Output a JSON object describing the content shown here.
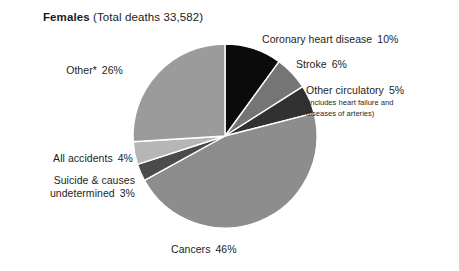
{
  "title": {
    "strong": "Females",
    "regular": "(Total deaths 33,582)"
  },
  "chart_data": {
    "type": "pie",
    "title": "Females (Total deaths 33,582)",
    "total_deaths": "33,582",
    "total_deaths_value": 33582,
    "units": "percent",
    "start_angle_deg": 0,
    "direction": "clockwise",
    "legend": "none (labels placed around perimeter)",
    "grid": false,
    "categories": [
      "Coronary heart disease",
      "Stroke",
      "Other circulatory",
      "Cancers",
      "Suicide & causes undetermined",
      "All accidents",
      "Other*"
    ],
    "values": [
      10,
      6,
      5,
      46,
      3,
      4,
      26
    ],
    "colors": [
      "#0b0b0b",
      "#757575",
      "#313131",
      "#8d8d8d",
      "#4b4b4b",
      "#b6b6b6",
      "#9b9b9b"
    ],
    "slices": [
      {
        "label": "Coronary heart disease",
        "percent": 10,
        "percent_text": "10%",
        "color": "#0b0b0b",
        "start_deg": 0,
        "end_deg": 36
      },
      {
        "label": "Stroke",
        "percent": 6,
        "percent_text": "6%",
        "color": "#757575",
        "start_deg": 36,
        "end_deg": 57.6
      },
      {
        "label": "Other circulatory",
        "sublabel": "(includes heart failure and diseases of arteries)",
        "percent": 5,
        "percent_text": "5%",
        "color": "#313131",
        "start_deg": 57.6,
        "end_deg": 75.6
      },
      {
        "label": "Cancers",
        "percent": 46,
        "percent_text": "46%",
        "color": "#8d8d8d",
        "start_deg": 75.6,
        "end_deg": 241.2
      },
      {
        "label": "Suicide & causes undetermined",
        "percent": 3,
        "percent_text": "3%",
        "color": "#4b4b4b",
        "start_deg": 241.2,
        "end_deg": 252
      },
      {
        "label": "All accidents",
        "percent": 4,
        "percent_text": "4%",
        "color": "#b6b6b6",
        "start_deg": 252,
        "end_deg": 266.4
      },
      {
        "label": "Other*",
        "percent": 26,
        "percent_text": "26%",
        "color": "#9b9b9b",
        "start_deg": 266.4,
        "end_deg": 360
      }
    ]
  },
  "labels": {
    "coronary_heart_disease": {
      "text": "Coronary heart disease",
      "pct": "10%"
    },
    "stroke": {
      "text": "Stroke",
      "pct": "6%"
    },
    "other_circulatory": {
      "text": "Other circulatory",
      "pct": "5%",
      "sub_line1": "(includes heart failure and",
      "sub_line2": "diseases of arteries)"
    },
    "other": {
      "text": "Other*",
      "pct": "26%"
    },
    "all_accidents": {
      "text": "All accidents",
      "pct": "4%"
    },
    "suicide": {
      "line1": "Suicide & causes",
      "line2": "undetermined",
      "pct": "3%"
    },
    "cancers": {
      "text": "Cancers",
      "pct": "46%"
    }
  },
  "geometry": {
    "center_x": 225,
    "center_y": 136,
    "radius": 92,
    "gap_color": "#ffffff",
    "gap_width": 1.4
  }
}
